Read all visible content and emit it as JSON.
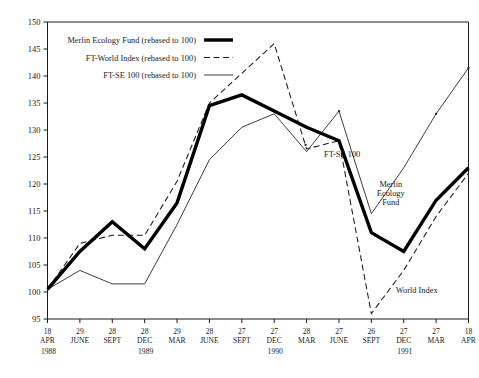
{
  "chart_data": {
    "type": "line",
    "title": "",
    "xlabel": "",
    "ylabel": "",
    "ylim": [
      95,
      150
    ],
    "ytick_step": 5,
    "grid": false,
    "legend_position": "top-left",
    "yticks": [
      "150",
      "145",
      "140",
      "135",
      "130",
      "125",
      "120",
      "115",
      "110",
      "105",
      "100",
      "95"
    ],
    "categories": [
      "18 APR",
      "29 JUNE",
      "28 SEPT",
      "28 DEC",
      "29 MAR",
      "28 JUNE",
      "27 SEPT",
      "27 DEC",
      "28 MAR",
      "27 JUNE",
      "26 SEPT",
      "27 DEC",
      "27 MAR",
      "18 APR"
    ],
    "x_days": [
      "18",
      "29",
      "28",
      "28",
      "29",
      "28",
      "27",
      "27",
      "28",
      "27",
      "26",
      "27",
      "27",
      "18"
    ],
    "x_months": [
      "APR",
      "JUNE",
      "SEPT",
      "DEC",
      "MAR",
      "JUNE",
      "SEPT",
      "DEC",
      "MAR",
      "JUNE",
      "SEPT",
      "DEC",
      "MAR",
      "APR"
    ],
    "year_groups": [
      {
        "label": "1988",
        "index": 0
      },
      {
        "label": "1989",
        "index": 3
      },
      {
        "label": "1990",
        "index": 7
      },
      {
        "label": "1991",
        "index": 11
      }
    ],
    "series": [
      {
        "name": "Merlin Ecology Fund (rebased to 100)",
        "short_name": "Merlin Ecology Fund",
        "style": "thick-solid",
        "color": "#000000",
        "values": [
          100.5,
          107.5,
          113.0,
          108.0,
          116.5,
          134.5,
          136.5,
          133.5,
          130.5,
          128.0,
          111.0,
          107.5,
          117.0,
          123.0
        ]
      },
      {
        "name": "FT-World Index (rebased to 100)",
        "short_name": "World Index",
        "style": "dashed",
        "color": "#1a1a1a",
        "values": [
          100.5,
          109.0,
          110.5,
          110.5,
          120.5,
          135.0,
          140.5,
          146.0,
          126.5,
          128.0,
          96.0,
          104.0,
          114.0,
          122.0
        ]
      },
      {
        "name": "FT-SE 100 (rebased to 100)",
        "short_name": "FT-SE 100",
        "style": "thin-solid",
        "color": "#1a1a1a",
        "values": [
          100.5,
          104.0,
          101.5,
          101.5,
          112.5,
          124.5,
          130.5,
          133.0,
          126.0,
          133.5,
          114.5,
          123.0,
          133.0,
          141.5
        ]
      }
    ],
    "annotations": [
      {
        "name": "ftse-label",
        "text": "FT-SE 100",
        "x_index": 9.1,
        "value": 125.0
      },
      {
        "name": "merlin-label",
        "text": "Merlin Ecology Fund",
        "lines": [
          "Merlin",
          "Ecology",
          "Fund"
        ],
        "x_index": 10.6,
        "value": 119.5
      },
      {
        "name": "world-index-label",
        "text": "World Index",
        "x_index": 11.4,
        "value": 99.8
      }
    ]
  },
  "legend": {
    "items": [
      {
        "label": "Merlin Ecology Fund (rebased to 100)",
        "style": "thick-solid"
      },
      {
        "label": "FT-World Index (rebased to 100)",
        "style": "dashed"
      },
      {
        "label": "FT-SE 100 (rebased to 100)",
        "style": "thin-solid"
      }
    ]
  },
  "footer": {
    "note": ""
  }
}
